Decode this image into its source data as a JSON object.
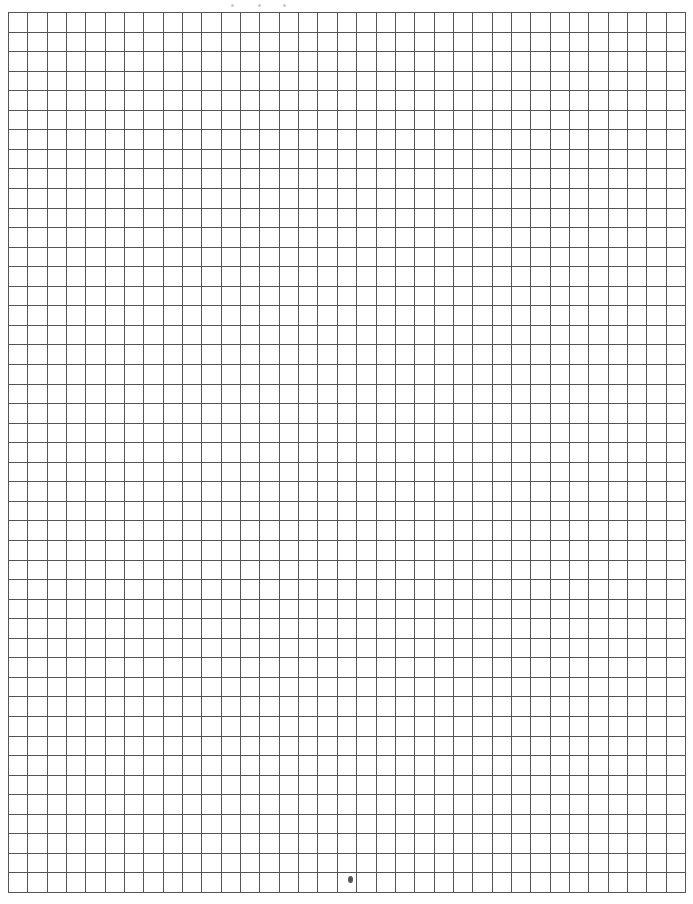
{
  "document": {
    "type": "graph-paper",
    "background_color": "#ffffff",
    "line_color": "#555555",
    "grid": {
      "columns": 35,
      "rows": 45,
      "left": 8,
      "top": 12,
      "width": 677,
      "height": 880
    },
    "header_marks": [
      6,
      33,
      58
    ],
    "marks": [
      {
        "name": "pencil-dot",
        "x": 350,
        "y": 879
      }
    ]
  }
}
